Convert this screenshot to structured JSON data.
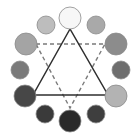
{
  "diagram": {
    "title": "",
    "type": "color-wheel-triad",
    "circles": [
      {
        "id": "top",
        "cx": 70,
        "cy": 18,
        "r": 11,
        "fill": "#f7f7f7"
      },
      {
        "id": "upper-right",
        "cx": 96,
        "cy": 25,
        "r": 9,
        "fill": "#a9a9a9"
      },
      {
        "id": "right-upper",
        "cx": 116,
        "cy": 44,
        "r": 11,
        "fill": "#8c8c8c"
      },
      {
        "id": "right-mid",
        "cx": 121,
        "cy": 70,
        "r": 9,
        "fill": "#6e6e6e"
      },
      {
        "id": "right-lower",
        "cx": 116,
        "cy": 96,
        "r": 11,
        "fill": "#b3b3b3"
      },
      {
        "id": "lower-right",
        "cx": 96,
        "cy": 114,
        "r": 9,
        "fill": "#3e3e3e"
      },
      {
        "id": "bottom",
        "cx": 70,
        "cy": 121,
        "r": 11,
        "fill": "#2a2a2a"
      },
      {
        "id": "lower-left",
        "cx": 45,
        "cy": 114,
        "r": 9,
        "fill": "#3a3a3a"
      },
      {
        "id": "left-lower",
        "cx": 25,
        "cy": 96,
        "r": 11,
        "fill": "#474747"
      },
      {
        "id": "left-mid",
        "cx": 20,
        "cy": 70,
        "r": 9,
        "fill": "#7a7a7a"
      },
      {
        "id": "left-upper",
        "cx": 26,
        "cy": 44,
        "r": 11,
        "fill": "#a4a4a4"
      },
      {
        "id": "upper-left",
        "cx": 46,
        "cy": 25,
        "r": 9,
        "fill": "#bdbdbd"
      }
    ],
    "solid_triangle": {
      "points": "70,29 33,95 108,95",
      "stroke": "#2f2f2f"
    },
    "dashed_triangle": {
      "points": "36,44 105,44 70,108",
      "stroke": "#7a7a7a"
    },
    "stroke_color": "#8a8a8a"
  }
}
